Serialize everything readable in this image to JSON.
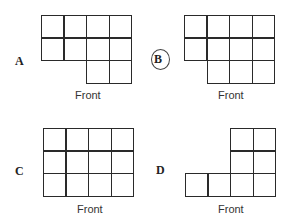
{
  "options": [
    {
      "label": "A",
      "caption": "Front",
      "circled": false,
      "rows": [
        [
          1,
          1,
          1,
          1
        ],
        [
          1,
          1,
          1,
          1
        ],
        [
          0,
          0,
          1,
          1
        ]
      ]
    },
    {
      "label": "B",
      "caption": "Front",
      "circled": true,
      "rows": [
        [
          1,
          1,
          1,
          1
        ],
        [
          1,
          1,
          1,
          1
        ],
        [
          0,
          1,
          1,
          1
        ]
      ]
    },
    {
      "label": "C",
      "caption": "Front",
      "circled": false,
      "rows": [
        [
          1,
          1,
          1,
          1
        ],
        [
          1,
          1,
          1,
          1
        ],
        [
          1,
          1,
          1,
          1
        ]
      ]
    },
    {
      "label": "D",
      "caption": "Front",
      "circled": false,
      "rows": [
        [
          0,
          0,
          1,
          1
        ],
        [
          0,
          0,
          1,
          1
        ],
        [
          1,
          1,
          1,
          1
        ]
      ]
    }
  ],
  "colors": {
    "line": "#2a2a2a",
    "background": "#ffffff"
  }
}
